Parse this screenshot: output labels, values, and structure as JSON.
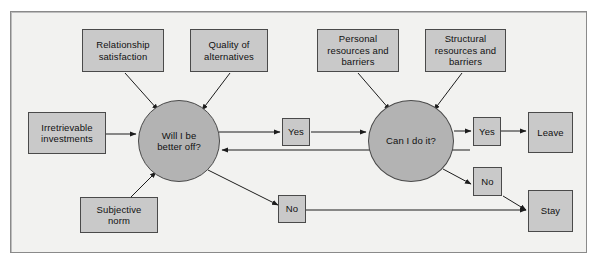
{
  "figure": {
    "type": "flow-diagram",
    "title": "",
    "background_color": "#f2f2f0",
    "frame_border_color": "#8a8a8a",
    "box_fill_color": "#c9c9c9",
    "circle_fill_color": "#b3b3b3",
    "stroke_color": "#4a4a4a"
  },
  "nodes": {
    "relationship_satisfaction": {
      "label": "Relationship\nsatisfaction",
      "shape": "rect"
    },
    "quality_of_alternatives": {
      "label": "Quality of\nalternatives",
      "shape": "rect"
    },
    "personal_resources": {
      "label": "Personal\nresources and\nbarriers",
      "shape": "rect"
    },
    "structural_resources": {
      "label": "Structural\nresources and\nbarriers",
      "shape": "rect"
    },
    "irretrievable_investments": {
      "label": "Irretrievable\ninvestments",
      "shape": "rect"
    },
    "subjective_norm": {
      "label": "Subjective\nnorm",
      "shape": "rect"
    },
    "will_i_be_better_off": {
      "label": "Will I be\nbetter off?",
      "shape": "circle"
    },
    "can_i_do_it": {
      "label": "Can I do it?",
      "shape": "circle"
    },
    "yes_left": {
      "label": "Yes",
      "shape": "rect"
    },
    "no_left": {
      "label": "No",
      "shape": "rect"
    },
    "yes_right": {
      "label": "Yes",
      "shape": "rect"
    },
    "no_right": {
      "label": "No",
      "shape": "rect"
    },
    "leave": {
      "label": "Leave",
      "shape": "rect"
    },
    "stay": {
      "label": "Stay",
      "shape": "rect"
    }
  },
  "edges": [
    {
      "from": "relationship_satisfaction",
      "to": "will_i_be_better_off",
      "arrow": "single"
    },
    {
      "from": "quality_of_alternatives",
      "to": "will_i_be_better_off",
      "arrow": "single"
    },
    {
      "from": "irretrievable_investments",
      "to": "will_i_be_better_off",
      "arrow": "single"
    },
    {
      "from": "subjective_norm",
      "to": "will_i_be_better_off",
      "arrow": "single"
    },
    {
      "from": "will_i_be_better_off",
      "to": "yes_left",
      "arrow": "single"
    },
    {
      "from": "yes_left",
      "to": "can_i_do_it",
      "arrow": "single"
    },
    {
      "from": "will_i_be_better_off",
      "to": "no_left",
      "arrow": "single"
    },
    {
      "from": "personal_resources",
      "to": "can_i_do_it",
      "arrow": "single"
    },
    {
      "from": "structural_resources",
      "to": "can_i_do_it",
      "arrow": "single"
    },
    {
      "from": "can_i_do_it",
      "to": "yes_right",
      "arrow": "single"
    },
    {
      "from": "yes_right",
      "to": "leave",
      "arrow": "single"
    },
    {
      "from": "can_i_do_it",
      "to": "no_right",
      "arrow": "single"
    },
    {
      "from": "no_right",
      "to": "stay",
      "arrow": "single"
    },
    {
      "from": "no_left",
      "to": "stay",
      "arrow": "single"
    },
    {
      "from": "can_i_do_it",
      "to": "will_i_be_better_off",
      "arrow": "single-feedback"
    }
  ]
}
